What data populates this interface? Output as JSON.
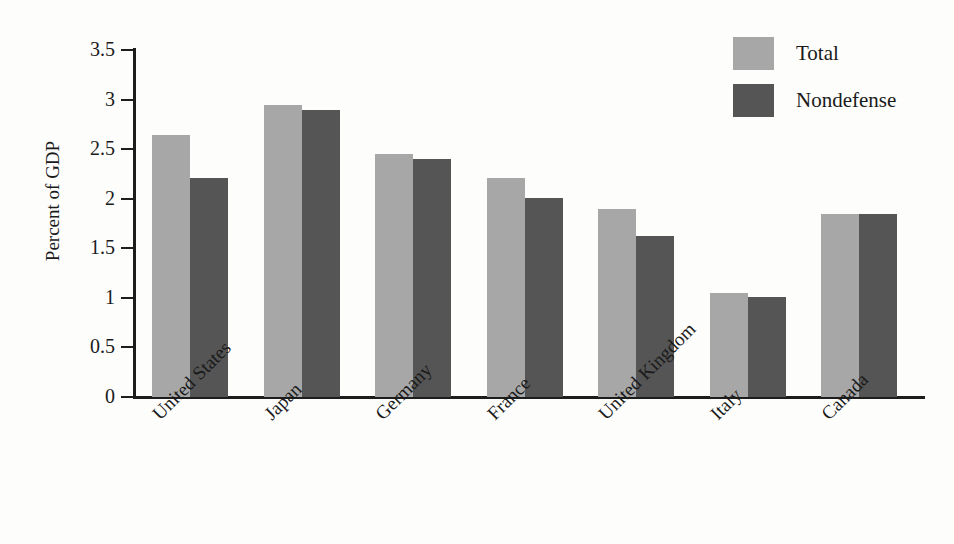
{
  "chart_data": {
    "type": "bar",
    "title": "",
    "xlabel": "",
    "ylabel": "Percent of GDP",
    "ylim": [
      0,
      3.5
    ],
    "ytick_labels": [
      "0",
      "0.5",
      "1",
      "1.5",
      "2",
      "2.5",
      "3",
      "3.5"
    ],
    "ytick_values": [
      0,
      0.5,
      1,
      1.5,
      2,
      2.5,
      3,
      3.5
    ],
    "grid": false,
    "legend_position": "top-right",
    "categories": [
      "United States",
      "Japan",
      "Germany",
      "France",
      "United Kingdom",
      "Italy",
      "Canada"
    ],
    "series": [
      {
        "name": "Total",
        "color": "#a7a7a7",
        "values": [
          2.64,
          2.95,
          2.45,
          2.21,
          1.9,
          1.05,
          1.85
        ]
      },
      {
        "name": "Nondefense",
        "color": "#555555",
        "values": [
          2.21,
          2.9,
          2.4,
          2.01,
          1.62,
          1.01,
          1.85
        ]
      }
    ]
  },
  "legend": {
    "entries": [
      {
        "label": "Total",
        "swatch": "#a7a7a7"
      },
      {
        "label": "Nondefense",
        "swatch": "#555555"
      }
    ]
  },
  "axis": {
    "y_title": "Percent of GDP"
  },
  "colors": {
    "total": "#a7a7a7",
    "nondefense": "#555555",
    "axis": "#1d1d1d",
    "background": "#fdfdfc"
  }
}
